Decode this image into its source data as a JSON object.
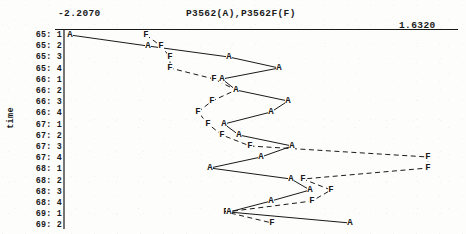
{
  "chart_data": {
    "type": "line",
    "title": "P3562(A),P3562F(F)",
    "xlabel": "",
    "ylabel": "time",
    "xlim": [
      -2.207,
      1.632
    ],
    "x_axis_left_label": "-2.2070",
    "x_axis_right_label": "1.6320",
    "grid": false,
    "legend": "none",
    "orientation": "horizontal-value-vertical-time",
    "categories": [
      "65: 1",
      "65: 2",
      "65: 3",
      "65: 4",
      "66: 1",
      "66: 2",
      "66: 3",
      "66: 4",
      "67: 1",
      "67: 2",
      "67: 3",
      "67: 4",
      "68: 1",
      "68: 2",
      "68: 3",
      "68: 4",
      "69: 1",
      "69: 2"
    ],
    "series": [
      {
        "name": "A",
        "marker": "A",
        "linestyle": "solid",
        "values": [
          -2.15,
          -1.39,
          -0.63,
          -0.2,
          -0.75,
          -0.62,
          -0.15,
          -0.3,
          -0.72,
          -0.6,
          -0.1,
          -0.42,
          -0.88,
          -0.16,
          0.01,
          -0.38,
          -1.1,
          -0.14
        ]
      },
      {
        "name": "F",
        "marker": "F",
        "linestyle": "dashed",
        "values": [
          -1.39,
          -1.27,
          -1.19,
          -1.19,
          -0.79,
          -0.6,
          -0.81,
          -0.93,
          -0.82,
          -0.69,
          -0.43,
          0.37,
          0.39,
          0.15,
          -0.06,
          -0.22,
          -1.12,
          -0.75
        ]
      }
    ]
  },
  "geometry": {
    "note": "pixel positions read off the scan",
    "axis_x": 64,
    "plot_right": 455,
    "row_top_y": 35,
    "row_step": 11.2,
    "series_a_px": [
      [
        70,
        35
      ],
      [
        148,
        46
      ],
      [
        229,
        57
      ],
      [
        279,
        68
      ],
      [
        222,
        79
      ],
      [
        236,
        90
      ],
      [
        288,
        101
      ],
      [
        271,
        112
      ],
      [
        224,
        124
      ],
      [
        239,
        135
      ],
      [
        292,
        146
      ],
      [
        261,
        157
      ],
      [
        210,
        168
      ],
      [
        291,
        179
      ],
      [
        310,
        190
      ],
      [
        271,
        201
      ],
      [
        229,
        212
      ],
      [
        350,
        223
      ]
    ],
    "series_f_px": [
      [
        146,
        35
      ],
      [
        161,
        46
      ],
      [
        170,
        57
      ],
      [
        170,
        68
      ],
      [
        214,
        79
      ],
      [
        236,
        90
      ],
      [
        212,
        101
      ],
      [
        198,
        112
      ],
      [
        208,
        124
      ],
      [
        222,
        135
      ],
      [
        250,
        146
      ],
      [
        428,
        157
      ],
      [
        428,
        168
      ],
      [
        303,
        179
      ],
      [
        331,
        190
      ],
      [
        312,
        201
      ],
      [
        226,
        212
      ],
      [
        272,
        223
      ]
    ]
  },
  "colors": {
    "ink": "#1a1a1a",
    "paper": "#fdfdfc",
    "axis": "#555555"
  }
}
